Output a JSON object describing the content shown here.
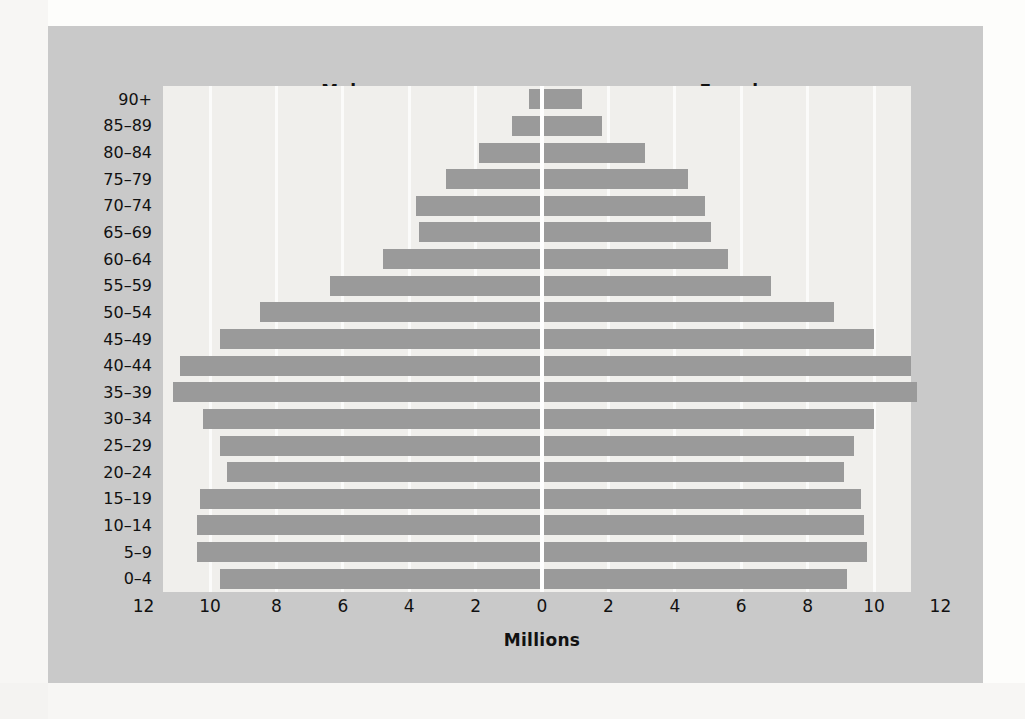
{
  "headers": {
    "left": "Males",
    "right": "Females"
  },
  "axis": {
    "x_title": "Millions",
    "x_ticks": [
      "12",
      "10",
      "8",
      "6",
      "4",
      "2",
      "0",
      "2",
      "4",
      "6",
      "8",
      "10",
      "12"
    ]
  },
  "colors": {
    "panel_background": "#c9c9c9",
    "plot_background": "#f0efec",
    "bar_fill": "#9a9a9a",
    "gridline": "#fbfbfa",
    "centerline": "#ffffff",
    "text": "#111111"
  },
  "chart_data": {
    "type": "bar",
    "subtype": "population-pyramid",
    "title": "",
    "xlabel": "Millions",
    "ylabel": "",
    "xlim": [
      -12,
      12
    ],
    "xticks": [
      -12,
      -10,
      -8,
      -6,
      -4,
      -2,
      0,
      2,
      4,
      6,
      8,
      10,
      12
    ],
    "xtick_labels": [
      "12",
      "10",
      "8",
      "6",
      "4",
      "2",
      "0",
      "2",
      "4",
      "6",
      "8",
      "10",
      "12"
    ],
    "grid": true,
    "legend": [
      "Males",
      "Females"
    ],
    "legend_position": "top (Males left, Females right)",
    "categories": [
      "90+",
      "85–89",
      "80–84",
      "75–79",
      "70–74",
      "65–69",
      "60–64",
      "55–59",
      "50–54",
      "45–49",
      "40–44",
      "35–39",
      "30–34",
      "25–29",
      "20–24",
      "15–19",
      "10–14",
      "5–9",
      "0–4"
    ],
    "series": [
      {
        "name": "Males",
        "side": "left",
        "values": [
          0.4,
          0.9,
          1.9,
          2.9,
          3.8,
          3.7,
          4.8,
          6.4,
          8.5,
          9.7,
          10.9,
          11.1,
          10.2,
          9.7,
          9.5,
          10.3,
          10.4,
          10.4,
          9.7
        ]
      },
      {
        "name": "Females",
        "side": "right",
        "values": [
          1.2,
          1.8,
          3.1,
          4.4,
          4.9,
          5.1,
          5.6,
          6.9,
          8.8,
          10.0,
          11.1,
          11.3,
          10.0,
          9.4,
          9.1,
          9.6,
          9.7,
          9.8,
          9.2
        ]
      }
    ]
  }
}
